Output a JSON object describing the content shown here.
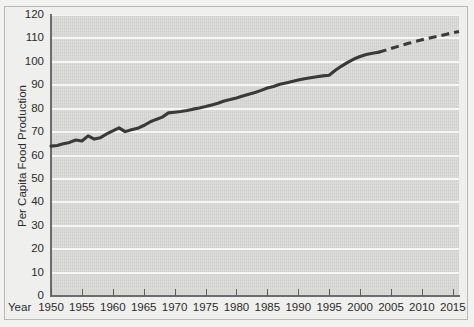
{
  "figure": {
    "background_color": "#efefed",
    "plot_background_color": "#d9d9d6",
    "gridline_color": "#f6f6f4",
    "axis_color": "#6d6d6d",
    "line_color": "#3a3a3a"
  },
  "axes": {
    "year_axis_label": "Year",
    "y_axis_title": "Per Capita Food Production"
  },
  "chart_data": {
    "type": "line",
    "title": "",
    "subtitle": "",
    "xlabel": "Year",
    "ylabel": "Per Capita Food Production",
    "xlim": [
      1950,
      2016
    ],
    "ylim": [
      0,
      120
    ],
    "grid": true,
    "grid_axis": "y",
    "legend": false,
    "legend_position": "none",
    "xticks": [
      1950,
      1955,
      1960,
      1965,
      1970,
      1975,
      1980,
      1985,
      1990,
      1995,
      2000,
      2005,
      2010,
      2015
    ],
    "xticklabels": [
      "1950",
      "1955",
      "1960",
      "1965",
      "1970",
      "1975",
      "1980",
      "1985",
      "1990",
      "1995",
      "2000",
      "2005",
      "2010",
      "2015"
    ],
    "yticks": [
      0,
      10,
      20,
      30,
      40,
      50,
      60,
      70,
      80,
      90,
      100,
      110,
      120
    ],
    "yticklabels": [
      "0",
      "10",
      "20",
      "30",
      "40",
      "50",
      "60",
      "70",
      "80",
      "90",
      "100",
      "110",
      "120"
    ],
    "series": [
      {
        "name": "Observed per capita food production",
        "style": "solid",
        "x": [
          1950,
          1951,
          1952,
          1953,
          1954,
          1955,
          1956,
          1957,
          1958,
          1959,
          1960,
          1961,
          1962,
          1963,
          1964,
          1965,
          1966,
          1967,
          1968,
          1969,
          1970,
          1971,
          1972,
          1973,
          1974,
          1975,
          1976,
          1977,
          1978,
          1979,
          1980,
          1981,
          1982,
          1983,
          1984,
          1985,
          1986,
          1987,
          1988,
          1989,
          1990,
          1991,
          1992,
          1993,
          1994,
          1995,
          1996,
          1997,
          1998,
          1999,
          2000,
          2001,
          2002,
          2003
        ],
        "y": [
          64,
          64.3,
          65,
          65.6,
          66.6,
          66.2,
          68.4,
          67,
          67.6,
          69.2,
          70.5,
          71.8,
          70.2,
          71,
          71.6,
          72.8,
          74.3,
          75.4,
          76.4,
          78.2,
          78.5,
          78.8,
          79.2,
          79.8,
          80.3,
          80.9,
          81.6,
          82.3,
          83.3,
          83.9,
          84.6,
          85.4,
          86.2,
          86.9,
          87.8,
          88.8,
          89.5,
          90.4,
          91,
          91.6,
          92.2,
          92.8,
          93.2,
          93.6,
          94,
          94.3,
          96.4,
          98.2,
          99.8,
          101.2,
          102.3,
          103.1,
          103.7,
          104.1
        ]
      },
      {
        "name": "Projected per capita food production",
        "style": "dashed",
        "x": [
          2003,
          2004,
          2005,
          2006,
          2007,
          2008,
          2009,
          2010,
          2011,
          2012,
          2013,
          2014,
          2015,
          2016
        ],
        "y": [
          104.1,
          104.9,
          105.7,
          106.5,
          107.3,
          108.0,
          108.7,
          109.4,
          110.0,
          110.6,
          111.2,
          111.8,
          112.4,
          113.0
        ]
      }
    ],
    "annotations": [
      {
        "text": "Solid line indicates historical data through about 2003; dashed line indicates projection to 2015."
      }
    ]
  }
}
